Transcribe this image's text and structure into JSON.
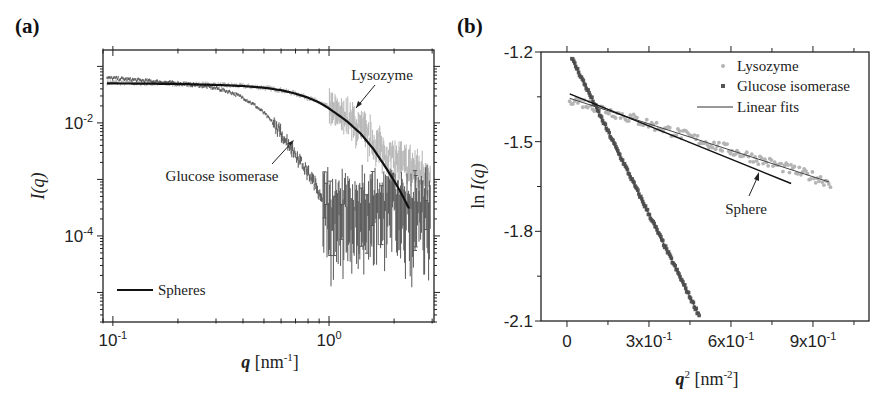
{
  "figure": {
    "panel_a_label": "(a)",
    "panel_b_label": "(b)"
  },
  "chart_data": [
    {
      "panel": "(a)",
      "type": "scatter",
      "title": "",
      "xlabel": "q [nm-1]",
      "xlabel_parts": {
        "var": "q",
        "unit": "[nm",
        "sup": "-1",
        "close": "]"
      },
      "ylabel": "I(q)",
      "xscale": "log",
      "yscale": "log",
      "xlim": [
        0.09,
        3.06
      ],
      "ylim": [
        3e-06,
        0.195
      ],
      "x_ticks": [
        {
          "value": 0.1,
          "label_base": "10",
          "label_exp": "-1"
        },
        {
          "value": 1,
          "label_base": "10",
          "label_exp": "0"
        }
      ],
      "y_ticks": [
        {
          "value": 0.01,
          "label_base": "10",
          "label_exp": "-2"
        },
        {
          "value": 0.0001,
          "label_base": "10",
          "label_exp": "-4"
        }
      ],
      "grid": false,
      "legend": {
        "position": "lower left",
        "entries": [
          {
            "label": "Spheres",
            "style": "line",
            "color": "#111111"
          }
        ]
      },
      "annotations": [
        {
          "text": "Lysozyme",
          "x": 1.05,
          "y": 0.085,
          "arrow_to": [
            0.85,
            0.027
          ]
        },
        {
          "text": "Glucose isomerase",
          "x": 0.22,
          "y": 0.00085,
          "arrow_to": [
            0.62,
            0.0037
          ]
        }
      ],
      "series": [
        {
          "name": "Lysozyme",
          "color": "#b4b4b4",
          "style": "points_with_errorbars",
          "x": [
            0.1,
            0.15,
            0.2,
            0.3,
            0.4,
            0.5,
            0.6,
            0.7,
            0.8,
            0.9,
            1.0,
            1.2,
            1.4,
            1.6,
            1.8,
            2.0,
            2.2,
            2.5,
            2.8
          ],
          "y": [
            0.052,
            0.05,
            0.049,
            0.047,
            0.045,
            0.042,
            0.038,
            0.033,
            0.028,
            0.023,
            0.019,
            0.012,
            0.0075,
            0.0045,
            0.003,
            0.0022,
            0.0018,
            0.0015,
            0.0013
          ]
        },
        {
          "name": "Glucose isomerase",
          "color": "#555555",
          "style": "points_with_errorbars",
          "x": [
            0.1,
            0.15,
            0.2,
            0.25,
            0.3,
            0.35,
            0.4,
            0.45,
            0.5,
            0.55,
            0.6,
            0.65,
            0.7,
            0.75,
            0.8,
            0.85,
            0.9,
            0.95,
            1.0,
            1.2,
            1.5,
            2.0,
            2.5,
            2.8
          ],
          "y": [
            0.062,
            0.055,
            0.05,
            0.046,
            0.041,
            0.035,
            0.028,
            0.021,
            0.015,
            0.01,
            0.0065,
            0.0042,
            0.0028,
            0.0019,
            0.0013,
            0.0009,
            0.0006,
            0.00045,
            0.0004,
            0.0004,
            0.0004,
            0.0004,
            0.0004,
            0.0004
          ]
        },
        {
          "name": "Spheres",
          "color": "#111111",
          "style": "line",
          "x": [
            0.1,
            0.2,
            0.3,
            0.4,
            0.5,
            0.6,
            0.7,
            0.8,
            0.9,
            1.0,
            1.2,
            1.4,
            1.6,
            1.8,
            2.0,
            2.2,
            2.35
          ],
          "y": [
            0.05,
            0.049,
            0.047,
            0.045,
            0.042,
            0.038,
            0.033,
            0.028,
            0.023,
            0.018,
            0.011,
            0.0065,
            0.0035,
            0.0018,
            0.00095,
            0.0005,
            0.0003
          ]
        }
      ]
    },
    {
      "panel": "(b)",
      "type": "scatter",
      "title": "",
      "xlabel": "q2 [nm-2]",
      "xlabel_parts": {
        "var": "q",
        "var_sup": "2",
        "unit": "[nm",
        "sup": "-2",
        "close": "]"
      },
      "ylabel": "ln I(q)",
      "xlim": [
        -0.095,
        1.105
      ],
      "ylim": [
        -2.1,
        -1.2
      ],
      "x_ticks": [
        {
          "value": 0,
          "label": "0"
        },
        {
          "value": 0.3,
          "label_base": "3x10",
          "label_exp": "-1"
        },
        {
          "value": 0.6,
          "label_base": "6x10",
          "label_exp": "-1"
        },
        {
          "value": 0.9,
          "label_base": "9x10",
          "label_exp": "-1"
        }
      ],
      "y_ticks": [
        {
          "value": -1.2,
          "label": "-1.2"
        },
        {
          "value": -1.5,
          "label": "-1.5"
        },
        {
          "value": -1.8,
          "label": "-1.8"
        },
        {
          "value": -2.1,
          "label": "-2.1"
        }
      ],
      "grid": false,
      "legend": {
        "position": "upper right",
        "entries": [
          {
            "label": "Lysozyme",
            "style": "dot",
            "color": "#b4b4b4"
          },
          {
            "label": "Glucose isomerase",
            "style": "square",
            "color": "#555555"
          },
          {
            "label": "Linear fits",
            "style": "line",
            "color": "#333333"
          }
        ]
      },
      "annotations": [
        {
          "text": "Sphere",
          "x": 0.71,
          "y": -1.72,
          "arrow_to": [
            0.71,
            -1.6
          ]
        }
      ],
      "series": [
        {
          "name": "Lysozyme",
          "color": "#b4b4b4",
          "style": "points",
          "x": [
            0.02,
            0.05,
            0.1,
            0.15,
            0.2,
            0.25,
            0.3,
            0.35,
            0.4,
            0.45,
            0.5,
            0.55,
            0.6,
            0.65,
            0.7,
            0.75,
            0.8,
            0.85,
            0.9,
            0.95
          ],
          "y": [
            -1.36,
            -1.37,
            -1.38,
            -1.39,
            -1.41,
            -1.42,
            -1.44,
            -1.45,
            -1.47,
            -1.48,
            -1.5,
            -1.51,
            -1.53,
            -1.54,
            -1.56,
            -1.57,
            -1.59,
            -1.6,
            -1.62,
            -1.63
          ]
        },
        {
          "name": "Glucose isomerase",
          "color": "#555555",
          "style": "squares",
          "x": [
            0.02,
            0.05,
            0.08,
            0.1,
            0.12,
            0.15,
            0.18,
            0.2,
            0.22,
            0.25,
            0.28,
            0.3,
            0.33,
            0.36,
            0.4,
            0.43,
            0.46,
            0.48
          ],
          "y": [
            -1.22,
            -1.26,
            -1.31,
            -1.35,
            -1.39,
            -1.45,
            -1.51,
            -1.55,
            -1.59,
            -1.65,
            -1.71,
            -1.74,
            -1.8,
            -1.86,
            -1.94,
            -1.99,
            -2.04,
            -2.07
          ]
        },
        {
          "name": "Lysozyme linear fit",
          "color": "#444444",
          "style": "line",
          "x": [
            0.01,
            0.96
          ],
          "y": [
            -1.355,
            -1.635
          ]
        },
        {
          "name": "Glucose isomerase linear fit",
          "color": "#444444",
          "style": "line",
          "x": [
            0.02,
            0.48
          ],
          "y": [
            -1.225,
            -2.075
          ]
        },
        {
          "name": "Sphere",
          "color": "#111111",
          "style": "line",
          "x": [
            0.01,
            0.82
          ],
          "y": [
            -1.34,
            -1.64
          ]
        }
      ]
    }
  ]
}
